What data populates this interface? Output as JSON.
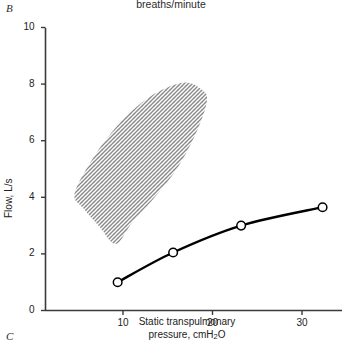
{
  "figure": {
    "panel_label_current": "B",
    "panel_label_next": "C",
    "top_caption": "breaths/minute"
  },
  "chart_data": {
    "type": "line",
    "title": "",
    "subtitle": "breaths/minute",
    "xlabel": "Static transpulmonary pressure, cmH2O",
    "xlabel_parts": {
      "pre": "Static transpulmonary",
      "post_line": "pressure, cmH",
      "sub": "2",
      "tail": "O"
    },
    "ylabel": "Flow, L/s",
    "xlim": [
      0,
      36
    ],
    "ylim": [
      0,
      10
    ],
    "xticks": [
      10,
      20,
      30
    ],
    "xtick_labels": [
      "10",
      "20",
      "30"
    ],
    "yticks": [
      0,
      2,
      4,
      6,
      8,
      10
    ],
    "ytick_labels": [
      "0",
      "2",
      "4",
      "6",
      "8",
      "10"
    ],
    "grid": false,
    "legend": "none",
    "series": [
      {
        "name": "Maximum expiratory flow curve",
        "marker": "open-circle",
        "line_style": "solid",
        "line_width": 2.4,
        "color": "#000000",
        "x": [
          9.4,
          15.6,
          23.2,
          32.3
        ],
        "y": [
          1.0,
          2.05,
          3.0,
          3.65
        ]
      }
    ],
    "shaded_region": {
      "name": "Hatched flow-pressure band",
      "style": "cross-hatched",
      "color": "#8c8c8c",
      "outline": "none",
      "upper_boundary_x": [
        4.6,
        7.0,
        10.0,
        13.0,
        15.5,
        17.3,
        18.6,
        19.4
      ],
      "upper_boundary_y": [
        4.15,
        5.55,
        6.75,
        7.55,
        7.95,
        8.05,
        7.85,
        7.45
      ],
      "lower_boundary_x": [
        19.4,
        18.2,
        16.0,
        13.4,
        11.0,
        9.2,
        7.4,
        5.6,
        4.6
      ],
      "lower_boundary_y": [
        7.45,
        6.3,
        5.0,
        3.95,
        3.1,
        2.35,
        2.95,
        3.6,
        4.15
      ]
    }
  }
}
